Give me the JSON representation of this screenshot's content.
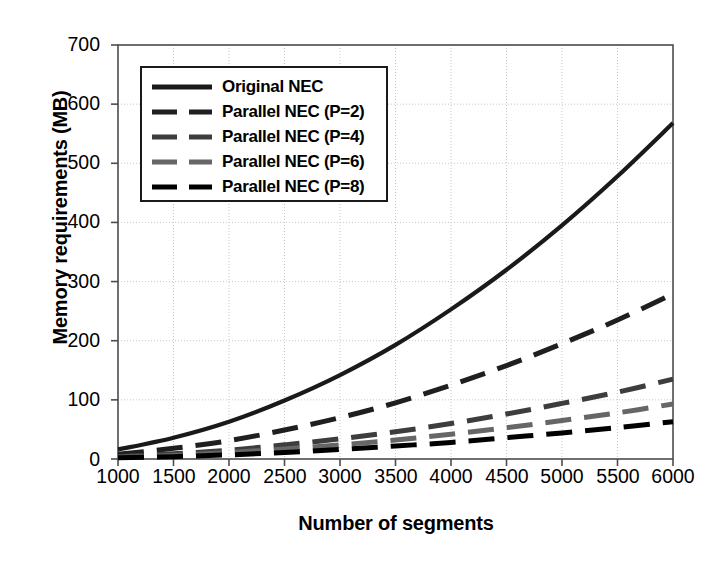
{
  "chart_data": {
    "type": "line",
    "title": "",
    "xlabel": "Number of segments",
    "ylabel": "Memory requirements (MB)",
    "xlim": [
      1000,
      6000
    ],
    "ylim": [
      0,
      700
    ],
    "xticks": [
      "1000",
      "1500",
      "2000",
      "2500",
      "3000",
      "3500",
      "4000",
      "4500",
      "5000",
      "5500",
      "6000"
    ],
    "yticks": [
      "0",
      "100",
      "200",
      "300",
      "400",
      "500",
      "600",
      "700"
    ],
    "grid": "dotted-gray-both-axes",
    "legend_position": "upper-left-inside",
    "x": [
      1000,
      1500,
      2000,
      2500,
      3000,
      3500,
      4000,
      4500,
      5000,
      5500,
      6000
    ],
    "series": [
      {
        "name": "Original NEC",
        "style": "solid",
        "color": "#1a1a1a",
        "values": [
          16,
          36,
          63,
          99,
          142,
          193,
          253,
          320,
          395,
          478,
          568
        ]
      },
      {
        "name": "Parallel NEC (P=2)",
        "style": "dashed",
        "color": "#1f1f1f",
        "values": [
          8,
          18,
          31,
          49,
          70,
          95,
          125,
          158,
          195,
          235,
          279
        ]
      },
      {
        "name": "Parallel NEC (P=4)",
        "style": "dashed",
        "color": "#3d3d3d",
        "values": [
          4,
          9,
          15,
          24,
          34,
          46,
          60,
          76,
          94,
          113,
          135
        ]
      },
      {
        "name": "Parallel NEC (P=6)",
        "style": "dashed",
        "color": "#666666",
        "values": [
          3,
          6,
          11,
          17,
          24,
          32,
          42,
          53,
          65,
          78,
          93
        ]
      },
      {
        "name": "Parallel NEC (P=8)",
        "style": "dashed",
        "color": "#000000",
        "values": [
          2,
          4,
          7,
          11,
          16,
          22,
          28,
          36,
          44,
          53,
          63
        ]
      }
    ]
  },
  "legend": {
    "items": [
      {
        "label": "Original NEC"
      },
      {
        "label": "Parallel NEC (P=2)"
      },
      {
        "label": "Parallel NEC (P=4)"
      },
      {
        "label": "Parallel NEC (P=6)"
      },
      {
        "label": "Parallel NEC (P=8)"
      }
    ]
  },
  "axes": {
    "x_title": "Number of segments",
    "y_title": "Memory requirements (MB)"
  },
  "colors": {
    "frame": "#4d4d4d",
    "grid": "#c8c8c8",
    "text": "#000000",
    "background": "#ffffff"
  }
}
